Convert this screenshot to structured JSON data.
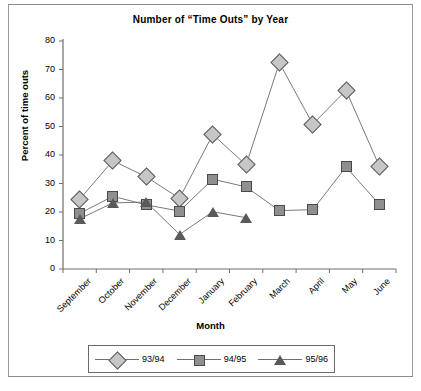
{
  "chart_data": {
    "type": "line",
    "title": "Number of “Time Outs” by Year",
    "xlabel": "Month",
    "ylabel": "Percent of time outs",
    "categories": [
      "September",
      "October",
      "November",
      "December",
      "January",
      "February",
      "March",
      "April",
      "May",
      "June"
    ],
    "ylim": [
      0,
      80
    ],
    "yticks": [
      0,
      10,
      20,
      30,
      40,
      50,
      60,
      70,
      80
    ],
    "grid": false,
    "legend_position": "bottom",
    "series": [
      {
        "name": "93/94",
        "marker": "diamond",
        "color": "#c6c6c6",
        "values": [
          24.5,
          38.0,
          32.3,
          24.8,
          47.2,
          36.5,
          72.3,
          50.8,
          62.7,
          36.1
        ]
      },
      {
        "name": "94/95",
        "marker": "square",
        "color": "#8f8f8f",
        "values": [
          19.5,
          25.5,
          22.5,
          20.3,
          31.5,
          28.8,
          20.5,
          20.8,
          35.8,
          22.7
        ]
      },
      {
        "name": "95/96",
        "marker": "triangle",
        "color": "#5a5a5a",
        "values": [
          17.6,
          23.2,
          23.5,
          12.1,
          20.1,
          18.0,
          null,
          null,
          null,
          null
        ]
      }
    ]
  },
  "axis": {
    "ytick_labels": [
      "80",
      "70",
      "60",
      "50",
      "40",
      "30",
      "20",
      "10",
      "0"
    ]
  },
  "legend": {
    "items": [
      {
        "label": "93/94"
      },
      {
        "label": "94/95"
      },
      {
        "label": "95/96"
      }
    ]
  }
}
